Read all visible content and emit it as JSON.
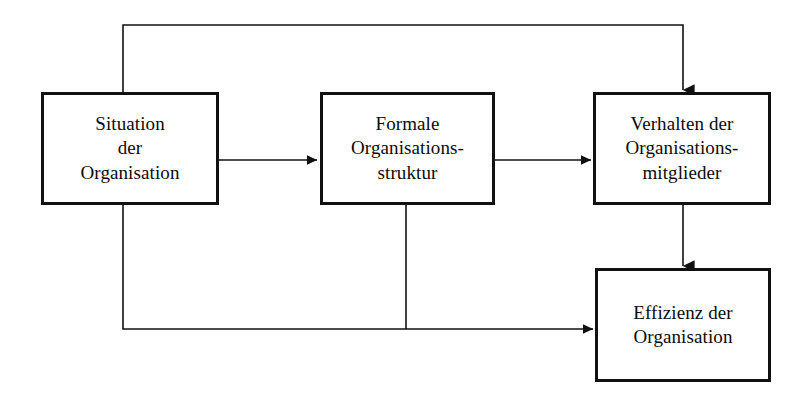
{
  "diagram": {
    "language": "de",
    "background_color": "#ffffff",
    "line_color": "#111111",
    "text_color": "#0b0b0b",
    "nodes": [
      {
        "id": "situation",
        "label": "Situation\nder\nOrganisation",
        "lines": [
          "Situation",
          "der",
          "Organisation"
        ]
      },
      {
        "id": "formale",
        "label": "Formale\nOrganisations-\nstruktur",
        "lines": [
          "Formale",
          "Organisations-",
          "struktur"
        ]
      },
      {
        "id": "verhalten",
        "label": "Verhalten der\nOrganisations-\nmitglieder",
        "lines": [
          "Verhalten der",
          "Organisations-",
          "mitglieder"
        ]
      },
      {
        "id": "effizienz",
        "label": "Effizienz der\nOrganisation",
        "lines": [
          "Effizienz der",
          "Organisation"
        ]
      }
    ],
    "edges": [
      {
        "id": "situation-to-formale",
        "from": "situation",
        "to": "formale",
        "style": "straight-arrow"
      },
      {
        "id": "formale-to-verhalten",
        "from": "formale",
        "to": "verhalten",
        "style": "straight-arrow"
      },
      {
        "id": "verhalten-to-effizienz",
        "from": "verhalten",
        "to": "effizienz",
        "style": "straight-arrow"
      },
      {
        "id": "situation-to-verhalten",
        "from": "situation",
        "to": "verhalten",
        "style": "routed-top-arrow"
      },
      {
        "id": "situation-to-effizienz",
        "from": "situation",
        "to": "effizienz",
        "style": "routed-bottom-arrow"
      },
      {
        "id": "formale-to-effizienz",
        "from": "formale",
        "to": "effizienz",
        "style": "routed-bottom-join"
      }
    ]
  }
}
